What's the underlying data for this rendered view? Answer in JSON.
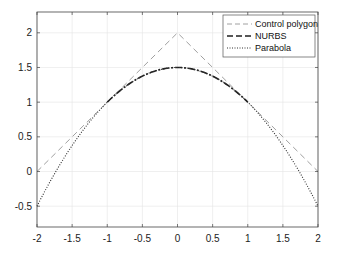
{
  "chart_data": {
    "type": "line",
    "title": "",
    "xlabel": "",
    "ylabel": "",
    "xlim": [
      -2,
      2
    ],
    "ylim": [
      -0.8,
      2.3
    ],
    "grid": true,
    "legend_position": "upper right",
    "x_ticks": [
      -2,
      -1.5,
      -1,
      -0.5,
      0,
      0.5,
      1,
      1.5,
      2
    ],
    "x_tick_labels": [
      "-2",
      "-1.5",
      "-1",
      "-0.5",
      "0",
      "0.5",
      "1",
      "1.5",
      "2"
    ],
    "y_ticks": [
      -0.5,
      0,
      0.5,
      1,
      1.5,
      2
    ],
    "y_tick_labels": [
      "-0.5",
      "0",
      "0.5",
      "1",
      "1.5",
      "2"
    ],
    "series": [
      {
        "name": "Control polygon",
        "style": "dashed",
        "color": "#a0a0a0",
        "x": [
          -2,
          0,
          2
        ],
        "y": [
          0,
          2,
          0
        ]
      },
      {
        "name": "NURBS",
        "style": "dashdot",
        "color": "#202020",
        "x": [
          -1.0,
          -0.75,
          -0.5,
          -0.25,
          0,
          0.25,
          0.5,
          0.75,
          1.0
        ],
        "y": [
          1.0,
          1.22,
          1.375,
          1.47,
          1.5,
          1.47,
          1.375,
          1.22,
          1.0
        ]
      },
      {
        "name": "Parabola",
        "style": "dotted",
        "color": "#303030",
        "x": [
          -2,
          -1.5,
          -1,
          -0.5,
          0,
          0.5,
          1,
          1.5,
          2
        ],
        "y": [
          -0.5,
          0.375,
          1.0,
          1.375,
          1.5,
          1.375,
          1.0,
          0.375,
          -0.5
        ]
      }
    ]
  },
  "legend": {
    "items": [
      {
        "label": "Control polygon"
      },
      {
        "label": "NURBS"
      },
      {
        "label": "Parabola"
      }
    ]
  }
}
